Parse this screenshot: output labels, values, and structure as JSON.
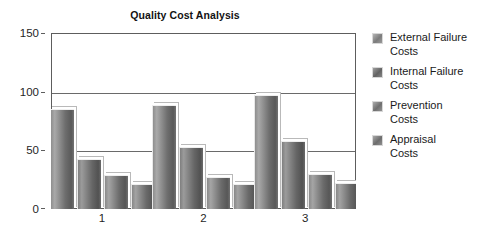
{
  "chart_data": {
    "type": "bar",
    "title": "Quality Cost Analysis",
    "xlabel": "",
    "ylabel": "",
    "categories": [
      "1",
      "2",
      "3"
    ],
    "series": [
      {
        "name": "External Failure\nCosts",
        "legend_label": "External Failure Costs",
        "values": [
          85,
          89,
          97
        ]
      },
      {
        "name": "Internal Failure\nCosts",
        "legend_label": "Internal Failure Costs",
        "values": [
          43,
          53,
          58
        ]
      },
      {
        "name": "Prevention\nCosts",
        "legend_label": "Prevention Costs",
        "values": [
          29,
          27,
          30
        ]
      },
      {
        "name": "Appraisal\nCosts",
        "legend_label": "Appraisal Costs",
        "values": [
          21,
          21,
          22
        ]
      }
    ],
    "ylim": [
      0,
      150
    ],
    "y_ticks": [
      0,
      50,
      100,
      150
    ],
    "y_tick_labels": [
      "0",
      "50",
      "100",
      "150"
    ],
    "grid": true,
    "grid_axis": "y",
    "legend_position": "right",
    "colors": {
      "series_fill": "#7d7d7d",
      "plot_border": "#5d5d5d",
      "gridline": "#6a6a6a",
      "background": "#ffffff",
      "text": "#1a1a1a"
    }
  }
}
